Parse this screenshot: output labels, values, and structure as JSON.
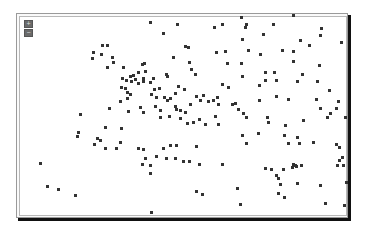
{
  "map": {
    "zoom_in_label": "+",
    "zoom_out_label": "−",
    "marker_color": "#333333"
  },
  "points": [
    [
      150,
      22
    ],
    [
      177,
      24
    ],
    [
      163,
      33
    ],
    [
      214,
      27
    ],
    [
      222,
      24
    ],
    [
      246,
      24
    ],
    [
      245,
      27
    ],
    [
      273,
      24
    ],
    [
      293,
      15
    ],
    [
      241,
      17
    ],
    [
      102,
      45
    ],
    [
      107,
      45
    ],
    [
      93,
      52
    ],
    [
      101,
      54
    ],
    [
      92,
      58
    ],
    [
      112,
      57
    ],
    [
      113,
      62
    ],
    [
      107,
      67
    ],
    [
      123,
      67
    ],
    [
      122,
      78
    ],
    [
      185,
      46
    ],
    [
      188,
      47
    ],
    [
      173,
      57
    ],
    [
      189,
      62
    ],
    [
      191,
      69
    ],
    [
      195,
      74
    ],
    [
      166,
      74
    ],
    [
      216,
      52
    ],
    [
      225,
      51
    ],
    [
      227,
      63
    ],
    [
      142,
      64
    ],
    [
      144,
      63
    ],
    [
      138,
      72
    ],
    [
      145,
      71
    ],
    [
      133,
      75
    ],
    [
      143,
      78
    ],
    [
      153,
      78
    ],
    [
      167,
      76
    ],
    [
      321,
      28
    ],
    [
      263,
      34
    ],
    [
      320,
      35
    ],
    [
      242,
      39
    ],
    [
      300,
      40
    ],
    [
      309,
      45
    ],
    [
      341,
      42
    ],
    [
      248,
      50
    ],
    [
      260,
      54
    ],
    [
      282,
      50
    ],
    [
      293,
      51
    ],
    [
      293,
      61
    ],
    [
      319,
      65
    ],
    [
      241,
      63
    ],
    [
      265,
      72
    ],
    [
      274,
      72
    ],
    [
      302,
      74
    ],
    [
      242,
      76
    ],
    [
      126,
      80
    ],
    [
      131,
      81
    ],
    [
      121,
      87
    ],
    [
      125,
      88
    ],
    [
      127,
      92
    ],
    [
      130,
      94
    ],
    [
      120,
      101
    ],
    [
      109,
      108
    ],
    [
      128,
      111
    ],
    [
      80,
      114
    ],
    [
      78,
      132
    ],
    [
      105,
      127
    ],
    [
      121,
      128
    ],
    [
      94,
      144
    ],
    [
      77,
      136
    ],
    [
      97,
      138
    ],
    [
      100,
      140
    ],
    [
      135,
      79
    ],
    [
      143,
      81
    ],
    [
      138,
      83
    ],
    [
      150,
      82
    ],
    [
      154,
      89
    ],
    [
      159,
      88
    ],
    [
      151,
      94
    ],
    [
      156,
      97
    ],
    [
      164,
      97
    ],
    [
      167,
      100
    ],
    [
      170,
      98
    ],
    [
      175,
      93
    ],
    [
      155,
      106
    ],
    [
      140,
      107
    ],
    [
      143,
      112
    ],
    [
      160,
      110
    ],
    [
      176,
      109
    ],
    [
      180,
      118
    ],
    [
      187,
      123
    ],
    [
      193,
      122
    ],
    [
      199,
      119
    ],
    [
      205,
      124
    ],
    [
      160,
      117
    ],
    [
      169,
      116
    ],
    [
      175,
      106
    ],
    [
      180,
      110
    ],
    [
      200,
      100
    ],
    [
      208,
      101
    ],
    [
      213,
      100
    ],
    [
      217,
      97
    ],
    [
      222,
      84
    ],
    [
      228,
      87
    ],
    [
      218,
      104
    ],
    [
      235,
      103
    ],
    [
      238,
      109
    ],
    [
      243,
      113
    ],
    [
      246,
      117
    ],
    [
      218,
      124
    ],
    [
      215,
      116
    ],
    [
      232,
      104
    ],
    [
      130,
      76
    ],
    [
      127,
      98
    ],
    [
      185,
      112
    ],
    [
      190,
      104
    ],
    [
      196,
      96
    ],
    [
      203,
      95
    ],
    [
      178,
      86
    ],
    [
      184,
      89
    ],
    [
      259,
      85
    ],
    [
      265,
      80
    ],
    [
      276,
      80
    ],
    [
      259,
      100
    ],
    [
      276,
      96
    ],
    [
      288,
      99
    ],
    [
      297,
      81
    ],
    [
      317,
      81
    ],
    [
      329,
      90
    ],
    [
      338,
      101
    ],
    [
      316,
      99
    ],
    [
      320,
      108
    ],
    [
      330,
      113
    ],
    [
      336,
      108
    ],
    [
      327,
      117
    ],
    [
      345,
      117
    ],
    [
      267,
      117
    ],
    [
      268,
      122
    ],
    [
      285,
      125
    ],
    [
      303,
      120
    ],
    [
      242,
      135
    ],
    [
      258,
      133
    ],
    [
      284,
      135
    ],
    [
      297,
      137
    ],
    [
      313,
      142
    ],
    [
      336,
      144
    ],
    [
      105,
      148
    ],
    [
      116,
      148
    ],
    [
      120,
      142
    ],
    [
      145,
      158
    ],
    [
      156,
      156
    ],
    [
      163,
      148
    ],
    [
      170,
      145
    ],
    [
      166,
      158
    ],
    [
      175,
      158
    ],
    [
      150,
      165
    ],
    [
      150,
      173
    ],
    [
      143,
      149
    ],
    [
      138,
      148
    ],
    [
      176,
      145
    ],
    [
      196,
      146
    ],
    [
      40,
      163
    ],
    [
      47,
      186
    ],
    [
      58,
      189
    ],
    [
      75,
      195
    ],
    [
      142,
      164
    ],
    [
      183,
      161
    ],
    [
      189,
      161
    ],
    [
      199,
      164
    ],
    [
      222,
      164
    ],
    [
      265,
      168
    ],
    [
      288,
      143
    ],
    [
      299,
      143
    ],
    [
      246,
      143
    ],
    [
      339,
      147
    ],
    [
      342,
      157
    ],
    [
      343,
      165
    ],
    [
      271,
      169
    ],
    [
      283,
      169
    ],
    [
      276,
      175
    ],
    [
      278,
      178
    ],
    [
      293,
      164
    ],
    [
      292,
      167
    ],
    [
      295,
      165
    ],
    [
      296,
      166
    ],
    [
      301,
      165
    ],
    [
      280,
      184
    ],
    [
      297,
      183
    ],
    [
      278,
      193
    ],
    [
      284,
      197
    ],
    [
      325,
      203
    ],
    [
      196,
      191
    ],
    [
      202,
      194
    ],
    [
      151,
      212
    ],
    [
      237,
      188
    ],
    [
      240,
      204
    ],
    [
      320,
      185
    ],
    [
      344,
      205
    ],
    [
      346,
      182
    ],
    [
      337,
      165
    ],
    [
      339,
      160
    ]
  ]
}
